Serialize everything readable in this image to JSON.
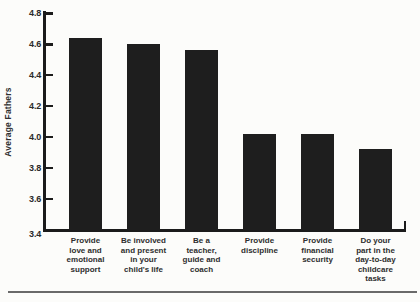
{
  "chart_data": {
    "type": "bar",
    "title": "",
    "xlabel": "",
    "ylabel": "Average Fathers",
    "categories": [
      "Provide\nlove and\nemotional\nsupport",
      "Be involved\nand present\nin your\nchild's life",
      "Be a\nteacher,\nguide and\ncoach",
      "Provide\ndiscipline",
      "Provide\nfinancial\nsecurity",
      "Do your\npart in the\nday-to-day\nchildcare\ntasks"
    ],
    "values": [
      4.64,
      4.6,
      4.56,
      4.02,
      4.02,
      3.92
    ],
    "ylim": [
      3.4,
      4.8
    ],
    "ytick_interval": 0.2,
    "yticks": [
      4.8,
      4.6,
      4.4,
      4.2,
      4.0,
      3.8,
      3.6,
      3.4
    ],
    "ytick_labels": [
      "4.8",
      "4.6",
      "4.4",
      "4.2",
      "4.0",
      "3.8",
      "3.6",
      "3.4"
    ],
    "grid": false,
    "legend": false,
    "bar_color": "#1e1e1e",
    "axis_color": "#1b1b1b",
    "text_color": "#2e2e2e",
    "background_color": "#fcfcfa"
  }
}
